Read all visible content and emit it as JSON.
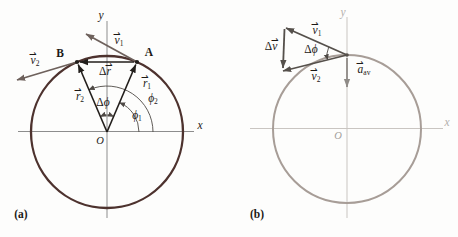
{
  "figure": {
    "panel_a_tag": "(a)",
    "panel_b_tag": "(b)"
  },
  "colors": {
    "panel_a_circle": "#4d322e",
    "panel_a_axes": "#8d8d8d",
    "panel_a_position_vectors": "#221e1b",
    "panel_a_velocity_vectors": "#6e615c",
    "angle_arcs": "#4e4945",
    "panel_b_circle": "#a79d97",
    "panel_b_axes": "#c9c5c1",
    "panel_b_velocity_vectors": "#55504b",
    "panel_b_acceleration_vector": "#8f8b87",
    "label_text": "#1c1916"
  },
  "panel_a": {
    "axis": {
      "x": "x",
      "y": "y",
      "origin": "O"
    },
    "points": {
      "A": "A",
      "B": "B"
    },
    "labels": {
      "v1": {
        "pre": "",
        "base": "v",
        "sub": "1",
        "accent": "⇀"
      },
      "v2": {
        "pre": "",
        "base": "v",
        "sub": "2",
        "accent": "⇀"
      },
      "r1": {
        "pre": "",
        "base": "r",
        "sub": "1",
        "accent": "⇀"
      },
      "r2": {
        "pre": "",
        "base": "r",
        "sub": "2",
        "accent": "⇀"
      },
      "dr": {
        "pre": "Δ",
        "base": "r",
        "sub": "",
        "accent": "⇀"
      },
      "dphi": {
        "pre": "Δ",
        "base": "ϕ",
        "sub": "",
        "accent": ""
      },
      "phi1": {
        "pre": "",
        "base": "ϕ",
        "sub": "1",
        "accent": ""
      },
      "phi2": {
        "pre": "",
        "base": "ϕ",
        "sub": "2",
        "accent": ""
      }
    }
  },
  "panel_b": {
    "axis": {
      "x": "x",
      "y": "y",
      "origin": "O"
    },
    "labels": {
      "v1": {
        "pre": "",
        "base": "v",
        "sub": "1",
        "accent": "⇀"
      },
      "v2": {
        "pre": "",
        "base": "v",
        "sub": "2",
        "accent": "⇀"
      },
      "dv": {
        "pre": "Δ",
        "base": "v",
        "sub": "",
        "accent": "⇀"
      },
      "dphi": {
        "pre": "Δ",
        "base": "ϕ",
        "sub": "",
        "accent": ""
      },
      "aav": {
        "pre": "",
        "base": "a",
        "sub": "av",
        "accent": "⇀"
      }
    }
  }
}
